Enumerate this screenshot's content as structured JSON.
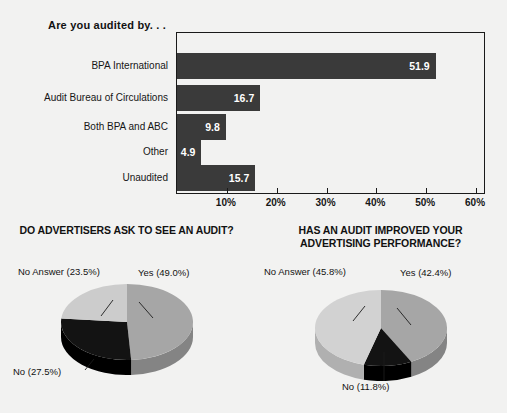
{
  "bar_section": {
    "title": "Are you audited by. . .",
    "axis_ticks": [
      "10%",
      "20%",
      "30%",
      "40%",
      "50%",
      "60%"
    ]
  },
  "pies": [
    {
      "title_line1": "DO ADVERTISERS ASK TO SEE AN AUDIT?",
      "title_line2": "",
      "labels": {
        "yes": "Yes (49.0%)",
        "no": "No (27.5%)",
        "no_answer": "No Answer (23.5%)"
      }
    },
    {
      "title_line1": "HAS AN AUDIT IMPROVED YOUR",
      "title_line2": "ADVERTISING PERFORMANCE?",
      "labels": {
        "yes": "Yes (42.4%)",
        "no": "No (11.8%)",
        "no_answer": "No Answer (45.8%)"
      }
    }
  ],
  "chart_data": [
    {
      "type": "bar",
      "orientation": "horizontal",
      "title": "Are you audited by. . .",
      "xlabel": "",
      "ylabel": "",
      "categories": [
        "BPA International",
        "Audit Bureau of Circulations",
        "Both BPA and ABC",
        "Other",
        "Unaudited"
      ],
      "values": [
        51.9,
        16.7,
        9.8,
        4.9,
        15.7
      ],
      "value_labels": [
        "51.9",
        "16.7",
        "9.8",
        "4.9",
        "15.7"
      ],
      "xlim": [
        0,
        62
      ],
      "xticks": [
        10,
        20,
        30,
        40,
        50,
        60
      ],
      "xtick_labels": [
        "10%",
        "20%",
        "30%",
        "40%",
        "50%",
        "60%"
      ],
      "grid": false,
      "legend": "none",
      "bar_color": "#3a3a3a",
      "value_label_color": "#ffffff"
    },
    {
      "type": "pie",
      "title": "DO ADVERTISERS ASK TO SEE AN AUDIT?",
      "labels": [
        "Yes",
        "No",
        "No Answer"
      ],
      "values": [
        49.0,
        27.5,
        23.5
      ],
      "value_labels": [
        "Yes (49.0%)",
        "No (27.5%)",
        "No Answer (23.5%)"
      ],
      "colors": [
        "#a6a6a6",
        "#131313",
        "#cccccc"
      ],
      "legend": "none",
      "style": "3d-exploded-none"
    },
    {
      "type": "pie",
      "title": "HAS AN AUDIT IMPROVED YOUR ADVERTISING PERFORMANCE?",
      "labels": [
        "Yes",
        "No",
        "No Answer"
      ],
      "values": [
        42.4,
        11.8,
        45.8
      ],
      "value_labels": [
        "Yes (42.4%)",
        "No (11.8%)",
        "No Answer (45.8%)"
      ],
      "colors": [
        "#a6a6a6",
        "#131313",
        "#d2d2d2"
      ],
      "legend": "none",
      "style": "3d-exploded-none"
    }
  ],
  "colors": {
    "background": "#f2f2f1",
    "bar_fill": "#3a3a3a",
    "frame": "#1a1a1a",
    "pie_yes": "#a6a6a6",
    "pie_no": "#131313",
    "pie_no_answer": "#cccccc"
  }
}
